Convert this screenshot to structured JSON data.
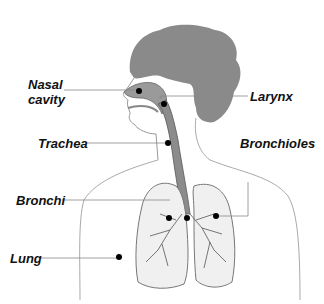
{
  "diagram": {
    "labels": {
      "nasal_cavity_1": "Nasal",
      "nasal_cavity_2": "cavity",
      "larynx": "Larynx",
      "trachea": "Trachea",
      "bronchioles": "Bronchioles",
      "bronchi": "Bronchi",
      "lung": "Lung"
    },
    "colors": {
      "hair": "#8a8a8a",
      "airway": "#9a9a9a",
      "lung_fill": "#f0f0f0",
      "outline": "#777777",
      "leader_line": "#888888",
      "marker": "#000000"
    }
  }
}
